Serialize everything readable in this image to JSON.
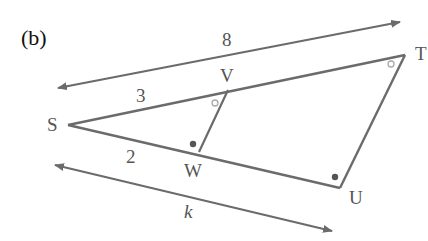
{
  "figure": {
    "part_label": "(b)",
    "colors": {
      "line": "#6b6b6b",
      "text": "#555555",
      "marker_dot": "#555555",
      "marker_circle": "#aaaaaa"
    },
    "vertices": {
      "S": {
        "label": "S",
        "x": 68,
        "y": 125
      },
      "V": {
        "label": "V",
        "x": 228,
        "y": 90
      },
      "T": {
        "label": "T",
        "x": 405,
        "y": 55
      },
      "W": {
        "label": "W",
        "x": 199,
        "y": 152
      },
      "U": {
        "label": "U",
        "x": 340,
        "y": 188
      }
    },
    "segments": [
      {
        "from": "S",
        "to": "T"
      },
      {
        "from": "S",
        "to": "U"
      },
      {
        "from": "T",
        "to": "U"
      },
      {
        "from": "V",
        "to": "W"
      }
    ],
    "measure_labels": {
      "ST": "8",
      "SV": "3",
      "SW": "2",
      "SU": "k"
    },
    "angle_markers": {
      "V_open_circle": "open circle at V (angle SVW)",
      "T_open_circle": "open circle at T (angle STU)",
      "W_dot": "filled dot at W (angle SWV)",
      "U_dot": "filled dot at U (angle SUT)"
    }
  }
}
